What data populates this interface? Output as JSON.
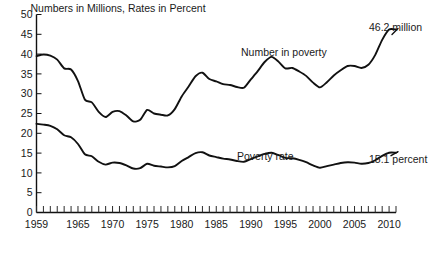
{
  "chart_data": {
    "type": "line",
    "title": "Numbers in Millions, Rates in Percent",
    "xlabel": "",
    "ylabel": "",
    "xlim": [
      1959,
      2011
    ],
    "ylim": [
      0,
      50
    ],
    "ytick_step": 5,
    "grid": false,
    "legend": "inline-annotations",
    "yticks": [
      "0",
      "5",
      "10",
      "15",
      "20",
      "25",
      "30",
      "35",
      "40",
      "45",
      "50"
    ],
    "xticks": [
      "1959",
      "1965",
      "1970",
      "1975",
      "1980",
      "1985",
      "1990",
      "1995",
      "2000",
      "2005",
      "2010"
    ],
    "xtick_values": [
      1959,
      1965,
      1970,
      1975,
      1980,
      1985,
      1990,
      1995,
      2000,
      2005,
      2010
    ],
    "minor_tick_interval": 1,
    "x": [
      1959,
      1960,
      1961,
      1962,
      1963,
      1964,
      1965,
      1966,
      1967,
      1968,
      1969,
      1970,
      1971,
      1972,
      1973,
      1974,
      1975,
      1976,
      1977,
      1978,
      1979,
      1980,
      1981,
      1982,
      1983,
      1984,
      1985,
      1986,
      1987,
      1988,
      1989,
      1990,
      1991,
      1992,
      1993,
      1994,
      1995,
      1996,
      1997,
      1998,
      1999,
      2000,
      2001,
      2002,
      2003,
      2004,
      2005,
      2006,
      2007,
      2008,
      2009,
      2010,
      2011
    ],
    "series": [
      {
        "name": "Number in poverty",
        "label": "Number in poverty",
        "unit": "millions",
        "endpoint_label": "46.2 million",
        "values": [
          39.5,
          39.9,
          39.6,
          38.6,
          36.4,
          36.1,
          33.2,
          28.5,
          27.8,
          25.4,
          24.1,
          25.4,
          25.6,
          24.5,
          23.0,
          23.4,
          25.9,
          25.0,
          24.7,
          24.5,
          26.1,
          29.3,
          31.8,
          34.4,
          35.3,
          33.7,
          33.1,
          32.4,
          32.2,
          31.7,
          31.5,
          33.6,
          35.7,
          38.0,
          39.3,
          38.1,
          36.4,
          36.5,
          35.6,
          34.5,
          32.8,
          31.6,
          32.9,
          34.6,
          35.9,
          37.0,
          37.0,
          36.5,
          37.3,
          39.8,
          43.6,
          46.2,
          46.2
        ]
      },
      {
        "name": "Poverty rate",
        "label": "Poverty rate",
        "unit": "percent",
        "endpoint_label": "15.1 percent",
        "values": [
          22.4,
          22.2,
          21.9,
          21.0,
          19.5,
          19.0,
          17.3,
          14.7,
          14.2,
          12.8,
          12.1,
          12.6,
          12.5,
          11.9,
          11.1,
          11.2,
          12.3,
          11.8,
          11.6,
          11.4,
          11.7,
          13.0,
          14.0,
          15.0,
          15.2,
          14.4,
          14.0,
          13.6,
          13.4,
          13.0,
          12.8,
          13.5,
          14.2,
          14.8,
          15.1,
          14.5,
          13.8,
          13.7,
          13.3,
          12.7,
          11.9,
          11.3,
          11.7,
          12.1,
          12.5,
          12.7,
          12.6,
          12.3,
          12.5,
          13.2,
          14.3,
          15.1,
          15.1
        ]
      }
    ],
    "annotations": [
      {
        "text": "Number in poverty",
        "series": "Number in poverty"
      },
      {
        "text": "Poverty rate",
        "series": "Poverty rate"
      },
      {
        "text": "46.2 million",
        "series": "Number in poverty"
      },
      {
        "text": "15.1 percent",
        "series": "Poverty rate"
      }
    ],
    "colors": {
      "line": "#111111",
      "axis": "#111111",
      "text": "#1a1a1a",
      "background": "#ffffff"
    }
  }
}
